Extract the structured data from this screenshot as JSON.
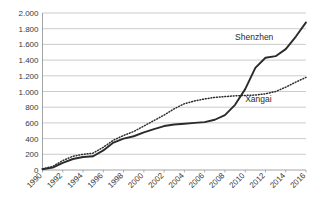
{
  "chart_data": {
    "type": "line",
    "title": "",
    "subtitle": "",
    "xlabel": "",
    "ylabel": "",
    "xlim": [
      1990,
      2016
    ],
    "ylim": [
      0,
      2000
    ],
    "grid": true,
    "legend_position": "inline-labels",
    "x": [
      1990,
      1991,
      1992,
      1993,
      1994,
      1995,
      1996,
      1997,
      1998,
      1999,
      2000,
      2001,
      2002,
      2003,
      2004,
      2005,
      2006,
      2007,
      2008,
      2009,
      2010,
      2011,
      2012,
      2013,
      2014,
      2015,
      2016
    ],
    "xtick_labels": [
      "1990",
      "1992",
      "1994",
      "1996",
      "1998",
      "2000",
      "2002",
      "2004",
      "2006",
      "2008",
      "2010",
      "2012",
      "2014",
      "2016"
    ],
    "xtick_values": [
      1990,
      1992,
      1994,
      1996,
      1998,
      2000,
      2002,
      2004,
      2006,
      2008,
      2010,
      2012,
      2014,
      2016
    ],
    "ytick_labels": [
      "0",
      "200",
      "400",
      "600",
      "800",
      "1.000",
      "1.200",
      "1.400",
      "1.600",
      "1.800",
      "2.000"
    ],
    "ytick_values": [
      0,
      200,
      400,
      600,
      800,
      1000,
      1200,
      1400,
      1600,
      1800,
      2000
    ],
    "series": [
      {
        "name": "Shenzhen",
        "style": "solid",
        "color": "#2b2b2b",
        "label_x": 2009,
        "label_y": 1660,
        "values": [
          10,
          30,
          90,
          140,
          165,
          175,
          250,
          350,
          400,
          430,
          480,
          520,
          560,
          580,
          590,
          600,
          610,
          640,
          700,
          830,
          1030,
          1300,
          1430,
          1450,
          1540,
          1700,
          1880
        ]
      },
      {
        "name": "Xangai",
        "style": "dotted",
        "color": "#2b2b2b",
        "label_x": 2010,
        "label_y": 870,
        "values": [
          15,
          45,
          120,
          175,
          200,
          215,
          290,
          380,
          440,
          490,
          560,
          630,
          700,
          780,
          845,
          880,
          905,
          925,
          935,
          945,
          950,
          955,
          970,
          1000,
          1055,
          1120,
          1180
        ]
      }
    ]
  }
}
